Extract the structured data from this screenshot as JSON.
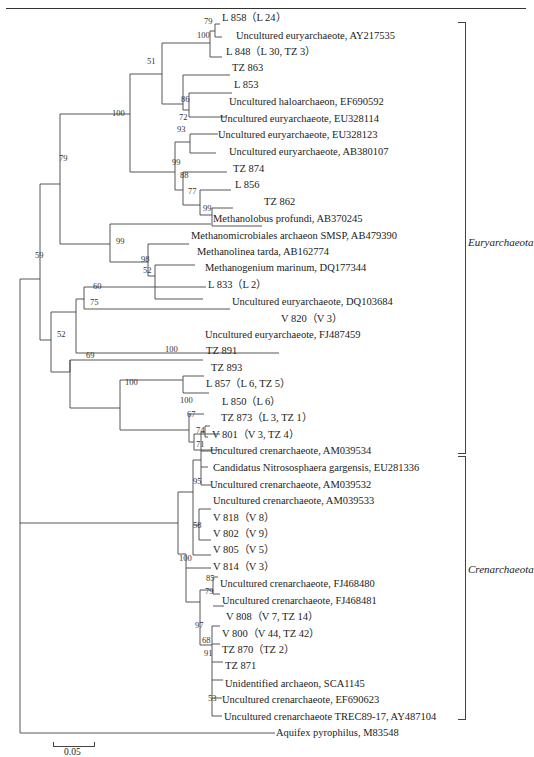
{
  "header": {
    "text": "内蒙盐湖 古菌 群生态研究"
  },
  "groups": [
    {
      "name": "Euryarchaeota"
    },
    {
      "name": "Crenarchaeota"
    }
  ],
  "leaves": [
    {
      "label": "L 858（L 24）",
      "x": 222,
      "y": 20
    },
    {
      "label": "Uncultured euryarchaeote, AY217535",
      "x": 236,
      "y": 39
    },
    {
      "label": "L 848（L 30, TZ 3）",
      "x": 226,
      "y": 57
    },
    {
      "label": "TZ 863",
      "x": 232,
      "y": 75
    },
    {
      "label": "L 853",
      "x": 234,
      "y": 93
    },
    {
      "label": "Uncultured haloarchaeon, EF690592",
      "x": 229,
      "y": 112
    },
    {
      "label": "Uncultured euryarchaeote, EU328114",
      "x": 220,
      "y": 130
    },
    {
      "label": "Uncultured euryarchaeote, EU328123",
      "x": 218,
      "y": 148
    },
    {
      "label": "Uncultured euryarchaeote, AB380107",
      "x": 229,
      "y": 167
    },
    {
      "label": "TZ 874",
      "x": 233,
      "y": 185
    },
    {
      "label": "L 856",
      "x": 235,
      "y": 203
    },
    {
      "label": "TZ 862",
      "x": 264,
      "y": 221
    },
    {
      "label": "Methanolobus profundi, AB370245",
      "x": 213,
      "y": 240
    },
    {
      "label": "Methanomicrobiales archaeon SMSP, AB479390",
      "x": 191,
      "y": 258
    },
    {
      "label": "Methanolinea tarda, AB162774",
      "x": 197,
      "y": 276
    },
    {
      "label": "Methanogenium marinum, DQ177344",
      "x": 205,
      "y": 294
    },
    {
      "label": "L 833（L 2）",
      "x": 208,
      "y": 312
    },
    {
      "label": "Uncultured euryarchaeote, DQ103684",
      "x": 232,
      "y": 331
    },
    {
      "label": "V 820（V 3）",
      "x": 281,
      "y": 349
    },
    {
      "label": "Uncultured euryarchaeote, FJ487459",
      "x": 205,
      "y": 367
    },
    {
      "label": "TZ 891",
      "x": 206,
      "y": 385
    },
    {
      "label": "TZ 893",
      "x": 211,
      "y": 403
    },
    {
      "label": "L 857（L 6, TZ 5）",
      "x": 206,
      "y": 421
    },
    {
      "label": "L 850（L 6）",
      "x": 222,
      "y": 440
    },
    {
      "label": "TZ 873（L 3, TZ 1）",
      "x": 221,
      "y": 458
    },
    {
      "label": "V 801（V 3, TZ 4）",
      "x": 212,
      "y": 476
    },
    {
      "label": "Uncultured crenarchaeote, AM039534",
      "x": 210,
      "y": 494
    },
    {
      "label": "Candidatus Nitrososphaera gargensis, EU281336",
      "x": 213,
      "y": 513
    },
    {
      "label": "Uncultured crenarchaeote, AM039532",
      "x": 210,
      "y": 531
    },
    {
      "label": "Uncultured crenarchaeote, AM039533",
      "x": 213,
      "y": 549
    },
    {
      "label": "V 818（V 8）",
      "x": 213,
      "y": 567
    },
    {
      "label": "V 802（V 9）",
      "x": 213,
      "y": 585
    },
    {
      "label": "V 805（V 5）",
      "x": 213,
      "y": 603
    },
    {
      "label": "V 814（V 3）",
      "x": 213,
      "y": 621
    },
    {
      "label": "Uncultured crenarchaeote, FJ468480",
      "x": 220,
      "y": 640
    },
    {
      "label": "Uncultured crenarchaeote, FJ468481",
      "x": 222,
      "y": 658
    },
    {
      "label": "V 808（V 7, TZ 14）",
      "x": 226,
      "y": 676
    },
    {
      "label": "V 800（V 44, TZ 42）",
      "x": 222,
      "y": 694
    },
    {
      "label": "TZ 870（TZ 2）",
      "x": 222,
      "y": 712
    },
    {
      "label": "TZ 871",
      "x": 225,
      "y": 730
    },
    {
      "label": "Unidentified archaeon, SCA1145",
      "x": 225,
      "y": 749
    },
    {
      "label": "Uncultured crenarchaeote, EF690623",
      "x": 222,
      "y": 767
    },
    {
      "label": "Uncultured crenarchaeote TREC89-17, AY487104",
      "x": 224,
      "y": 785
    },
    {
      "label": "Aquifex pyrophilus, M83548",
      "x": 276,
      "y": 803
    }
  ],
  "bootstraps": [
    {
      "v": "79",
      "x": 204,
      "y": 17
    },
    {
      "v": "100",
      "x": 197,
      "y": 31
    },
    {
      "v": "51",
      "x": 147,
      "y": 57
    },
    {
      "v": "86",
      "x": 181,
      "y": 95
    },
    {
      "v": "72",
      "x": 179,
      "y": 113
    },
    {
      "v": "100",
      "x": 112,
      "y": 109
    },
    {
      "v": "93",
      "x": 177,
      "y": 125
    },
    {
      "v": "99",
      "x": 172,
      "y": 158
    },
    {
      "v": "88",
      "x": 180,
      "y": 171
    },
    {
      "v": "77",
      "x": 188,
      "y": 187
    },
    {
      "v": "99",
      "x": 203,
      "y": 204
    },
    {
      "v": "79",
      "x": 59,
      "y": 154
    },
    {
      "v": "99",
      "x": 116,
      "y": 237
    },
    {
      "v": "98",
      "x": 141,
      "y": 255
    },
    {
      "v": "52",
      "x": 143,
      "y": 266
    },
    {
      "v": "59",
      "x": 35,
      "y": 251
    },
    {
      "v": "60",
      "x": 93,
      "y": 282
    },
    {
      "v": "75",
      "x": 90,
      "y": 298
    },
    {
      "v": "52",
      "x": 57,
      "y": 330
    },
    {
      "v": "69",
      "x": 86,
      "y": 351
    },
    {
      "v": "100",
      "x": 165,
      "y": 345
    },
    {
      "v": "100",
      "x": 125,
      "y": 378
    },
    {
      "v": "100",
      "x": 180,
      "y": 396
    },
    {
      "v": "67",
      "x": 187,
      "y": 410
    },
    {
      "v": "74",
      "x": 196,
      "y": 426
    },
    {
      "v": "71",
      "x": 196,
      "y": 440
    },
    {
      "v": "95",
      "x": 193,
      "y": 477
    },
    {
      "v": "58",
      "x": 193,
      "y": 521
    },
    {
      "v": "100",
      "x": 179,
      "y": 554
    },
    {
      "v": "85",
      "x": 206,
      "y": 574
    },
    {
      "v": "79",
      "x": 205,
      "y": 587
    },
    {
      "v": "97",
      "x": 195,
      "y": 621
    },
    {
      "v": "68",
      "x": 202,
      "y": 636
    },
    {
      "v": "91",
      "x": 204,
      "y": 649
    },
    {
      "v": "53",
      "x": 208,
      "y": 694
    }
  ],
  "scale_bar": {
    "label": "0.05"
  }
}
